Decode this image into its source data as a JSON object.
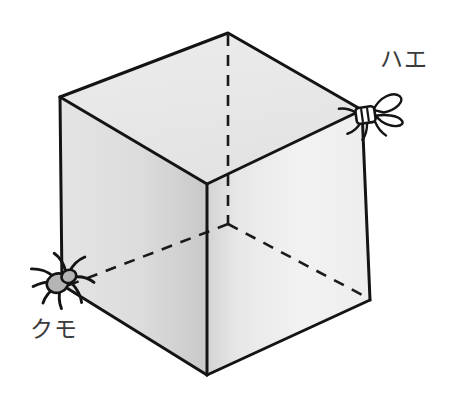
{
  "figure": {
    "background_color": "#ffffff",
    "stroke_color": "#1a1a1a",
    "labels": {
      "fly": "ハエ",
      "spider": "クモ"
    },
    "label_color": "#3b3b3b",
    "icons": {
      "fly": "fly-icon",
      "spider": "spider-icon"
    },
    "faces": {
      "top_fill": "#e9e9e9",
      "left_fill": "#dedede",
      "right_fill": "#f1f1f1"
    },
    "body_fill": "#b5b5b5",
    "wing_fill": "#ffffff",
    "vertices": {
      "top_back": [
        228,
        33
      ],
      "top_left": [
        60,
        97
      ],
      "top_right": [
        362,
        110
      ],
      "top_front": [
        207,
        184
      ],
      "bottom_left": [
        62,
        285
      ],
      "bottom_right": [
        370,
        300
      ],
      "bottom_front": [
        207,
        375
      ],
      "bottom_back_hidden": [
        228,
        224
      ]
    },
    "hidden_edges_style": "dashed",
    "visible_edges_style": "solid"
  }
}
